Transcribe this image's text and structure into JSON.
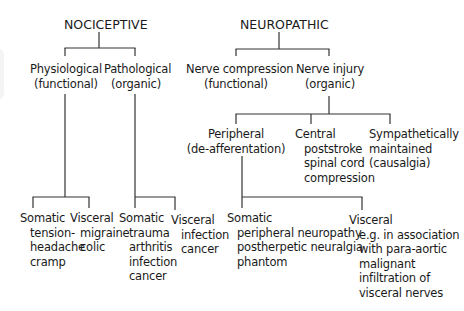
{
  "diagram": {
    "nociceptive": {
      "title": "NOCICEPTIVE",
      "physiological": {
        "label": "Physiological",
        "sub": "(functional)",
        "somatic": {
          "label": "Somatic",
          "items": [
            "tension-",
            "headache",
            "cramp"
          ]
        },
        "visceral": {
          "label": "Visceral",
          "items": [
            "migraine",
            "colic"
          ]
        }
      },
      "pathological": {
        "label": "Pathological",
        "sub": "(organic)",
        "somatic": {
          "label": "Somatic",
          "items": [
            "trauma",
            "arthritis",
            "infection",
            "cancer"
          ]
        },
        "visceral": {
          "label": "Visceral",
          "items": [
            "infection",
            "cancer"
          ]
        }
      }
    },
    "neuropathic": {
      "title": "NEUROPATHIC",
      "compression": {
        "label": "Nerve compression",
        "sub": "(functional)"
      },
      "injury": {
        "label": "Nerve injury",
        "sub": "(organic)",
        "peripheral": {
          "label": "Peripheral",
          "sub": "(de-afferentation)",
          "somatic": {
            "label": "Somatic",
            "items": [
              "peripheral neuropathy",
              "postherpetic neuralgia",
              "phantom"
            ]
          },
          "visceral": {
            "label": "Visceral",
            "items": [
              "e.g. in association",
              "with para-aortic",
              "malignant",
              "infiltration of",
              "visceral nerves"
            ]
          }
        },
        "central": {
          "label": "Central",
          "items": [
            "poststroke",
            "spinal cord",
            "compression"
          ]
        },
        "sympathetic": {
          "label": "Sympathetically",
          "items": [
            "maintained",
            "(causalgia)"
          ]
        }
      }
    }
  }
}
